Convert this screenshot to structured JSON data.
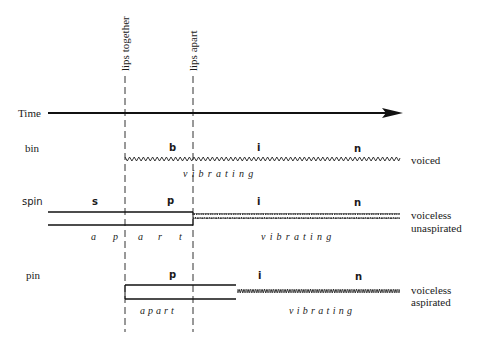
{
  "markers": {
    "lips_together": "lips together",
    "lips_apart": "lips apart"
  },
  "time_axis": {
    "label": "Time"
  },
  "rows": [
    {
      "word": "bin",
      "segments": [
        "b",
        "i",
        "n"
      ],
      "states": [
        "vibrating"
      ],
      "classification": [
        "voiced"
      ]
    },
    {
      "word": "spin",
      "segments": [
        "s",
        "p",
        "i",
        "n"
      ],
      "states": [
        "a",
        "p",
        "a",
        "r",
        "t",
        "vibrating"
      ],
      "classification": [
        "voiceless",
        "unaspirated"
      ]
    },
    {
      "word": "pin",
      "segments": [
        "p",
        "i",
        "n"
      ],
      "states": [
        "apart",
        "vibrating"
      ],
      "classification": [
        "voiceless",
        "aspirated"
      ]
    }
  ]
}
